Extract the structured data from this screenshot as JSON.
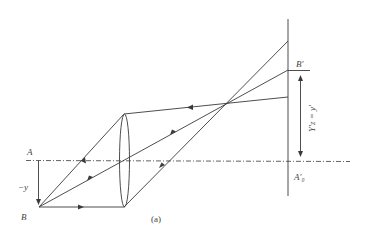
{
  "figure": {
    "caption": "(a)",
    "labels": {
      "A": "A",
      "B": "B",
      "neg_y": "−y",
      "B_prime": "B'",
      "A0_prime": "A'₀",
      "image_height": "Y'z = y'"
    },
    "elements": {
      "optical_axis": "dash-dot horizontal axis",
      "lens": "biconvex lens",
      "screen": "vertical image plane",
      "rays": [
        "ray from B through lens top, returning",
        "ray from B through lens center",
        "ray from B parallel to axis"
      ]
    },
    "colors": {
      "line": "#3a3a3a",
      "text": "#444444",
      "background": "#ffffff"
    }
  }
}
